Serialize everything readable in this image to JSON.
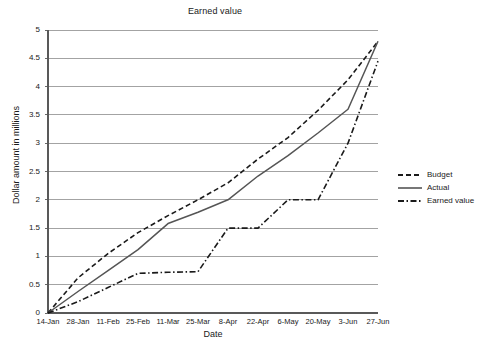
{
  "chart_data": {
    "type": "line",
    "title": "Earned value",
    "xlabel": "Date",
    "ylabel": "Dollar amount in millions",
    "ylim": [
      0,
      5
    ],
    "ytick_step": 0.5,
    "grid": true,
    "legend_position": "right",
    "yticks": [
      "0",
      "0.5",
      "1",
      "1.5",
      "2",
      "2.5",
      "3",
      "3.5",
      "4",
      "4.5",
      "5"
    ],
    "categories": [
      "14-Jan",
      "28-Jan",
      "11-Feb",
      "25-Feb",
      "11-Mar",
      "25-Mar",
      "8-Apr",
      "22-Apr",
      "6-May",
      "20-May",
      "3-Jun",
      "27-Jun"
    ],
    "series": [
      {
        "name": "Budget",
        "style": "dashed",
        "color": "#1a1a1a",
        "values": [
          0,
          0.62,
          1.05,
          1.42,
          1.72,
          2.0,
          2.3,
          2.72,
          3.1,
          3.58,
          4.12,
          4.8
        ]
      },
      {
        "name": "Actual",
        "style": "solid",
        "color": "#555555",
        "values": [
          0,
          0.38,
          0.75,
          1.12,
          1.58,
          1.78,
          2.0,
          2.42,
          2.78,
          3.18,
          3.6,
          4.8
        ]
      },
      {
        "name": "Earned value",
        "style": "dash-dot",
        "color": "#1a1a1a",
        "values": [
          0,
          0.2,
          0.45,
          0.7,
          0.72,
          0.73,
          1.5,
          1.5,
          2.0,
          2.0,
          3.0,
          4.45
        ]
      }
    ]
  },
  "legend": {
    "items": [
      {
        "label": "Budget"
      },
      {
        "label": "Actual"
      },
      {
        "label": "Earned value"
      }
    ]
  },
  "colors": {
    "axis": "#595959",
    "grid": "#8c8c8c",
    "budget": "#1a1a1a",
    "actual": "#555555",
    "earned": "#1a1a1a",
    "background": "#ffffff"
  }
}
